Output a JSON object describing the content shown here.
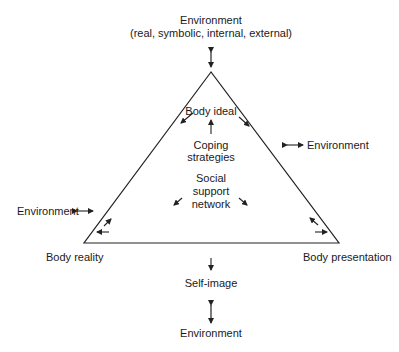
{
  "diagram": {
    "top_environment": {
      "title": "Environment",
      "subtitle": "(real, symbolic, internal, external)"
    },
    "inner": {
      "body_ideal": "Body ideal",
      "coping_line1": "Coping",
      "coping_line2": "strategies",
      "social_line1": "Social",
      "social_line2": "support",
      "social_line3": "network"
    },
    "right_environment": "Environment",
    "left_environment": "Environment",
    "corners": {
      "left": "Body reality",
      "right": "Body presentation"
    },
    "self_image": "Self-image",
    "bottom_environment": "Environment",
    "colors": {
      "line": "#222222",
      "background": "#ffffff"
    }
  }
}
